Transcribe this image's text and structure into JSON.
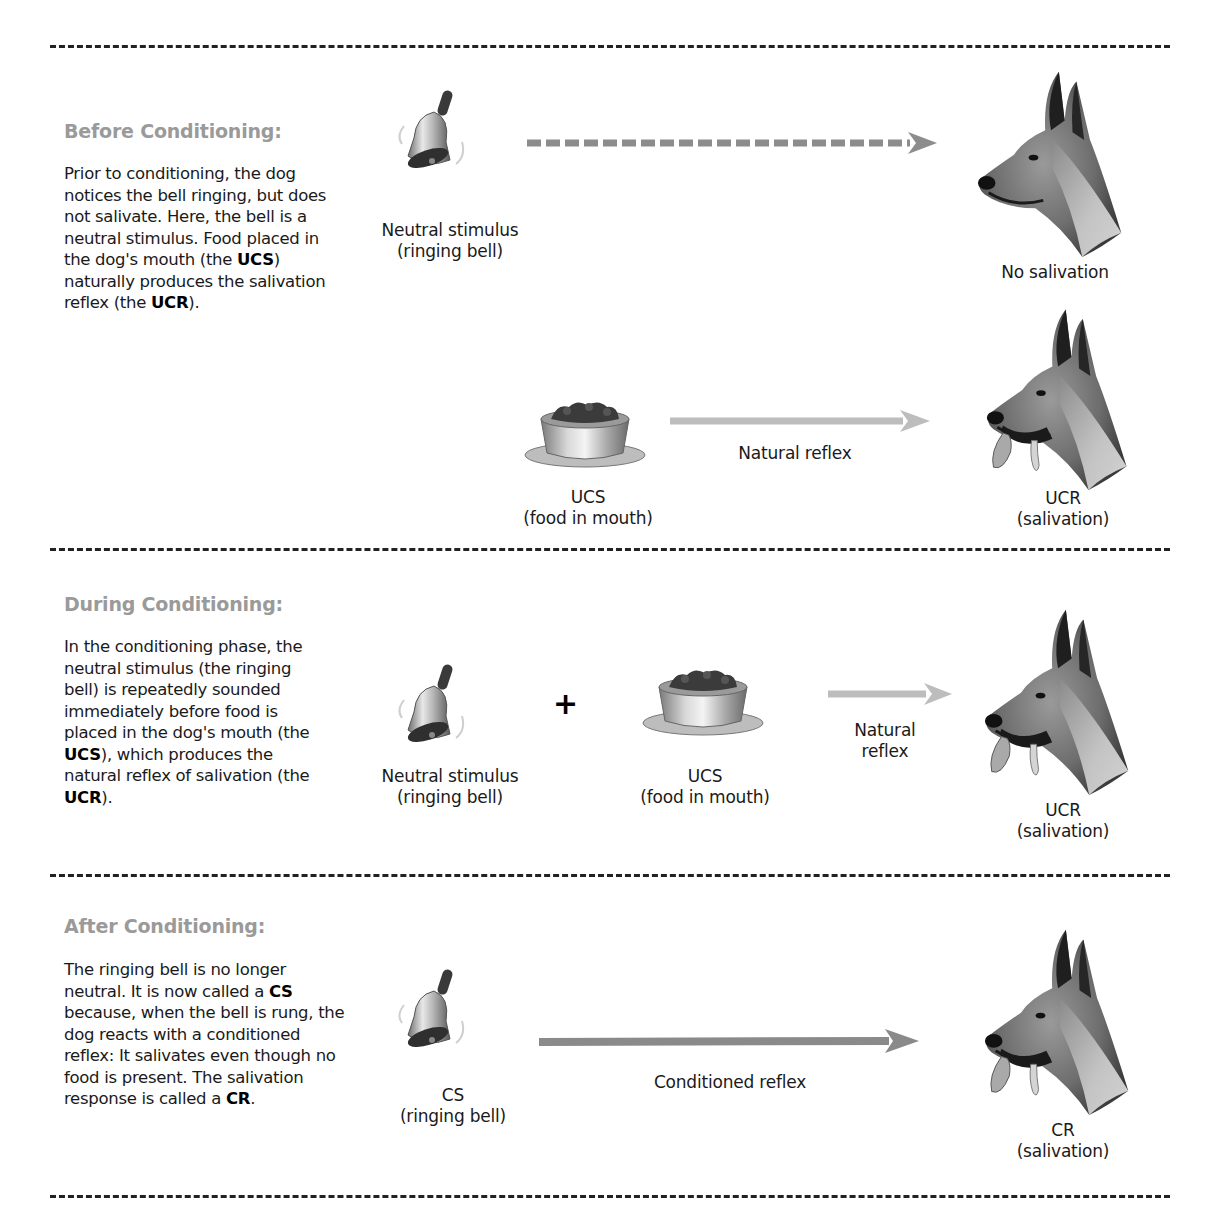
{
  "diagram_title": "Classical conditioning (Pavlov's dog)",
  "colors": {
    "heading": "#9a9a9a",
    "natural_arrow": "#bdbdbd",
    "dashed_arrow": "#8c8c8c",
    "conditioned_arrow": "#8a8a8a",
    "divider": "#222222"
  },
  "sections": [
    {
      "id": "before",
      "heading": "Before Conditioning:",
      "description_parts": [
        {
          "text": "Prior to conditioning, the dog notices the bell ringing, but does not salivate. Here, the bell is a neutral stimulus. Food placed in the dog's mouth (the ",
          "bold": false
        },
        {
          "text": "UCS",
          "bold": true
        },
        {
          "text": ") naturally produces the salivation reflex (the ",
          "bold": false
        },
        {
          "text": "UCR",
          "bold": true
        },
        {
          "text": ").",
          "bold": false
        }
      ],
      "rows": [
        {
          "stimulus": {
            "icon": "bell-icon",
            "line1": "Neutral stimulus",
            "line2": "(ringing bell)"
          },
          "arrow": {
            "style": "dashed",
            "label": ""
          },
          "response": {
            "icon": "dog-head-icon",
            "line1": "No salivation",
            "line2": ""
          }
        },
        {
          "stimulus": {
            "icon": "food-bowl-icon",
            "line1": "UCS",
            "line2": "(food in mouth)"
          },
          "arrow": {
            "style": "solid-light",
            "label": "Natural reflex"
          },
          "response": {
            "icon": "salivating-dog-icon",
            "line1": "UCR",
            "line2": "(salivation)"
          }
        }
      ]
    },
    {
      "id": "during",
      "heading": "During Conditioning:",
      "description_parts": [
        {
          "text": "In the conditioning phase, the neutral stimulus (the ringing bell) is repeatedly sounded immediately before food is placed in the dog's mouth (the ",
          "bold": false
        },
        {
          "text": "UCS",
          "bold": true
        },
        {
          "text": "), which produces the natural reflex of salivation (the ",
          "bold": false
        },
        {
          "text": "UCR",
          "bold": true
        },
        {
          "text": ").",
          "bold": false
        }
      ],
      "rows": [
        {
          "stimulus": {
            "icon": "bell-icon",
            "line1": "Neutral stimulus",
            "line2": "(ringing bell)"
          },
          "operator": "+",
          "stimulus2": {
            "icon": "food-bowl-icon",
            "line1": "UCS",
            "line2": "(food in mouth)"
          },
          "arrow": {
            "style": "solid-light",
            "label_line1": "Natural",
            "label_line2": "reflex"
          },
          "response": {
            "icon": "salivating-dog-icon",
            "line1": "UCR",
            "line2": "(salivation)"
          }
        }
      ]
    },
    {
      "id": "after",
      "heading": "After Conditioning:",
      "description_parts": [
        {
          "text": "The ringing bell is no longer neutral. It is now called a ",
          "bold": false
        },
        {
          "text": "CS",
          "bold": true
        },
        {
          "text": " because, when the bell is rung, the dog reacts with a conditioned reflex: It salivates even though no food is present. The salivation response is called a ",
          "bold": false
        },
        {
          "text": "CR",
          "bold": true
        },
        {
          "text": ".",
          "bold": false
        }
      ],
      "rows": [
        {
          "stimulus": {
            "icon": "bell-icon",
            "line1": "CS",
            "line2": "(ringing bell)"
          },
          "arrow": {
            "style": "solid-dark",
            "label": "Conditioned reflex"
          },
          "response": {
            "icon": "salivating-dog-icon",
            "line1": "CR",
            "line2": "(salivation)"
          }
        }
      ]
    }
  ]
}
